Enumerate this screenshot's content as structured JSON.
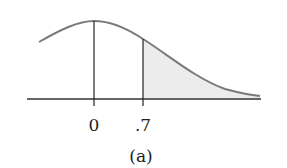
{
  "figure": {
    "caption": "(a)",
    "tick_labels": [
      "0",
      ".7"
    ],
    "shade_color": "#ececec",
    "curve_color": "#7a7a7a",
    "line_color": "#222222"
  }
}
